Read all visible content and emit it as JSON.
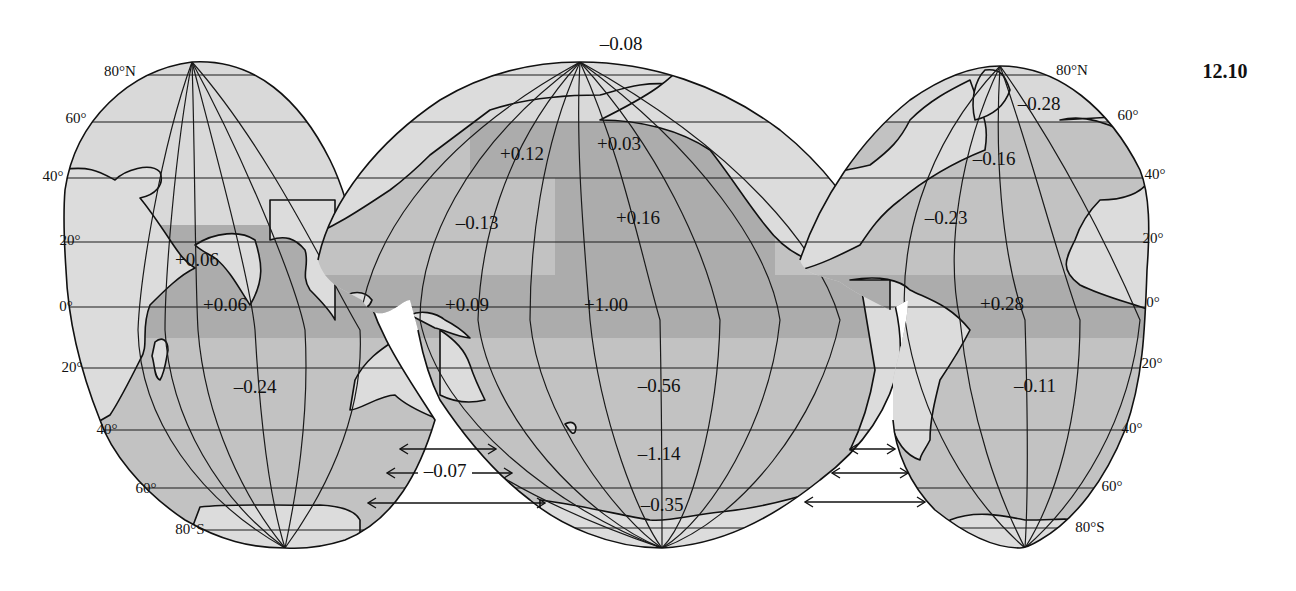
{
  "figure": {
    "number": "12.10",
    "projection": "interrupted (three ocean lobes)"
  },
  "latitude_labels": {
    "left": [
      "80°N",
      "60°",
      "40°",
      "20°",
      "0°",
      "20°",
      "40°",
      "60°",
      "80°S"
    ],
    "right": [
      "80°N",
      "60°",
      "40°",
      "20°",
      "0°",
      "20°",
      "40°",
      "60°",
      "80°S"
    ]
  },
  "shading": {
    "light": "#d9d9d9",
    "medium": "#c2c2c2",
    "dark": "#acacac",
    "line": "#111111"
  },
  "regions": {
    "indian_ocean": {
      "north_equatorial": "+0.06",
      "equatorial": "+0.06",
      "south": "-0.24"
    },
    "pacific_ocean": {
      "arctic": "-0.08",
      "northwest": "+0.12",
      "north_central": "+0.03",
      "west_subtropical": "-0.13",
      "east_subtropical": "+0.16",
      "west_equatorial": "+0.09",
      "equatorial": "+1.00",
      "south": "-0.56",
      "southern_ocean": "-1.14",
      "antarctic": "-0.35"
    },
    "atlantic_ocean": {
      "arctic": "-0.28",
      "north": "-0.16",
      "subtropical": "-0.23",
      "equatorial": "+0.28",
      "south": "-0.11"
    },
    "interbasin_exchange": {
      "indian_pacific": "-0.07"
    }
  }
}
